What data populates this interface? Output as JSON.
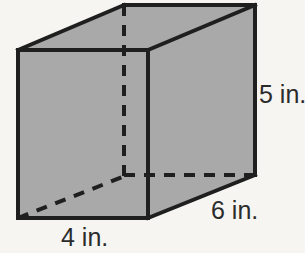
{
  "figure": {
    "name": "rectangular-prism-diagram",
    "shape_type": "rectangular prism",
    "units": "in.",
    "colors": {
      "background": "#f6f5f2",
      "face_fill": "#a9a9a9",
      "edge_stroke": "#1f1f1f",
      "hidden_edge_stroke": "#1f1f1f",
      "label_text": "#2b2b2b"
    },
    "labels": {
      "height": "5 in.",
      "depth": "6 in.",
      "width": "4 in."
    },
    "dimensions": [
      {
        "name": "height",
        "value": 5,
        "unit": "in.",
        "text": "5 in."
      },
      {
        "name": "depth",
        "value": 6,
        "unit": "in.",
        "text": "6 in."
      },
      {
        "name": "width",
        "value": 4,
        "unit": "in.",
        "text": "4 in."
      }
    ],
    "geometry": {
      "front_face": "18,50 148,50 148,218 18,218",
      "top_face": "18,50 124,5 255,5 148,50",
      "right_face": "148,50 255,5 255,175 148,218",
      "hidden_vertical": "124,5 124,175",
      "hidden_horizontal": "124,175 255,175",
      "hidden_diagonal": "18,218 124,175"
    }
  }
}
